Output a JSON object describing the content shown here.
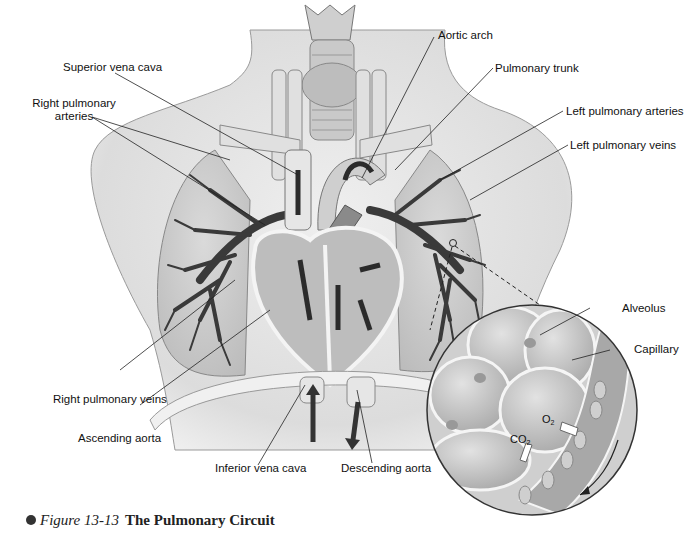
{
  "figure": {
    "number": "Figure 13-13",
    "title": "The Pulmonary Circuit"
  },
  "labels": {
    "superior_vena_cava": "Superior vena cava",
    "right_pulmonary_arteries_line1": "Right pulmonary",
    "right_pulmonary_arteries_line2": "arteries",
    "aortic_arch": "Aortic arch",
    "pulmonary_trunk": "Pulmonary trunk",
    "left_pulmonary_arteries": "Left pulmonary arteries",
    "left_pulmonary_veins": "Left pulmonary veins",
    "alveolus": "Alveolus",
    "capillary": "Capillary",
    "right_pulmonary_veins": "Right pulmonary veins",
    "ascending_aorta": "Ascending aorta",
    "inferior_vena_cava": "Inferior vena cava",
    "descending_aorta": "Descending aorta"
  },
  "gases": {
    "oxygen_base": "O",
    "oxygen_sub": "2",
    "co2_base": "CO",
    "co2_sub": "2"
  },
  "colors": {
    "background": "#ffffff",
    "body": "#e4e4e4",
    "body_shadow": "#c9c9c9",
    "lung": "#d2d2d2",
    "vessel_dark": "#3a3a3a",
    "vessel_light": "#e8e8e8",
    "heart": "#bdbdbd",
    "leader_line": "#222222"
  }
}
